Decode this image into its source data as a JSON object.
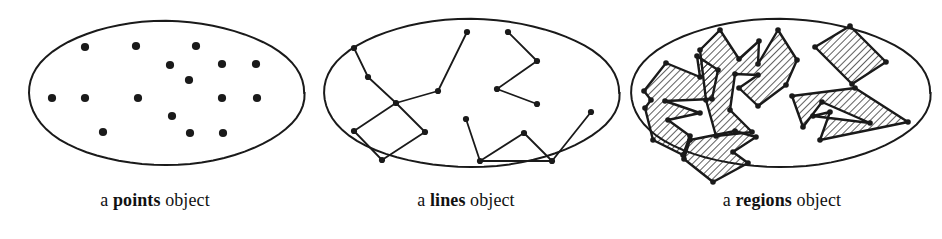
{
  "figure": {
    "width": 942,
    "height": 239,
    "background": "#ffffff",
    "ink_color": "#1a1a1a"
  },
  "panels": [
    {
      "id": "points",
      "caption_prefix": "a ",
      "caption_keyword": "points",
      "caption_suffix": " object",
      "ellipse": {
        "cx": 166,
        "cy": 93,
        "rx": 138,
        "ry": 72
      },
      "points": [
        {
          "x": 85,
          "y": 47
        },
        {
          "x": 136,
          "y": 46
        },
        {
          "x": 196,
          "y": 46
        },
        {
          "x": 170,
          "y": 65
        },
        {
          "x": 222,
          "y": 64
        },
        {
          "x": 256,
          "y": 64
        },
        {
          "x": 189,
          "y": 80
        },
        {
          "x": 52,
          "y": 98
        },
        {
          "x": 85,
          "y": 98
        },
        {
          "x": 138,
          "y": 98
        },
        {
          "x": 222,
          "y": 98
        },
        {
          "x": 257,
          "y": 98
        },
        {
          "x": 172,
          "y": 116
        },
        {
          "x": 103,
          "y": 132
        },
        {
          "x": 190,
          "y": 133
        },
        {
          "x": 223,
          "y": 133
        }
      ],
      "dot_radius": 4.1
    },
    {
      "id": "lines",
      "caption_prefix": "a ",
      "caption_keyword": "lines",
      "caption_suffix": " object",
      "ellipse": {
        "cx": 471,
        "cy": 93,
        "rx": 148,
        "ry": 74
      },
      "polylines": [
        [
          {
            "x": 354,
            "y": 48
          },
          {
            "x": 368,
            "y": 77
          },
          {
            "x": 396,
            "y": 103
          },
          {
            "x": 438,
            "y": 91
          },
          {
            "x": 467,
            "y": 32
          }
        ],
        [
          {
            "x": 354,
            "y": 131
          },
          {
            "x": 396,
            "y": 103
          },
          {
            "x": 425,
            "y": 132
          },
          {
            "x": 382,
            "y": 160
          },
          {
            "x": 354,
            "y": 131
          }
        ],
        [
          {
            "x": 508,
            "y": 32
          },
          {
            "x": 537,
            "y": 61
          },
          {
            "x": 497,
            "y": 89
          },
          {
            "x": 537,
            "y": 104
          }
        ],
        [
          {
            "x": 466,
            "y": 119
          },
          {
            "x": 480,
            "y": 161
          },
          {
            "x": 524,
            "y": 133
          },
          {
            "x": 552,
            "y": 161
          },
          {
            "x": 591,
            "y": 112
          }
        ],
        [
          {
            "x": 480,
            "y": 161
          },
          {
            "x": 552,
            "y": 161
          }
        ]
      ],
      "vertex_radius": 3.1
    },
    {
      "id": "regions",
      "caption_prefix": "a ",
      "caption_keyword": "regions",
      "caption_suffix": " object",
      "ellipse": {
        "cx": 780,
        "cy": 93,
        "rx": 150,
        "ry": 74
      },
      "hatch": {
        "angle_deg": 45,
        "spacing": 5,
        "stroke_width": 1.4
      },
      "polygons": [
        [
          {
            "x": 666,
            "y": 63
          },
          {
            "x": 700,
            "y": 77
          },
          {
            "x": 697,
            "y": 56
          },
          {
            "x": 718,
            "y": 70
          },
          {
            "x": 712,
            "y": 99
          },
          {
            "x": 665,
            "y": 101
          },
          {
            "x": 700,
            "y": 113
          },
          {
            "x": 668,
            "y": 120
          },
          {
            "x": 690,
            "y": 136
          },
          {
            "x": 683,
            "y": 155
          },
          {
            "x": 653,
            "y": 140
          },
          {
            "x": 645,
            "y": 108
          },
          {
            "x": 651,
            "y": 100
          },
          {
            "x": 644,
            "y": 91
          }
        ],
        [
          {
            "x": 700,
            "y": 50
          },
          {
            "x": 720,
            "y": 30
          },
          {
            "x": 739,
            "y": 59
          },
          {
            "x": 759,
            "y": 41
          },
          {
            "x": 758,
            "y": 64
          },
          {
            "x": 778,
            "y": 30
          },
          {
            "x": 797,
            "y": 60
          },
          {
            "x": 786,
            "y": 85
          },
          {
            "x": 758,
            "y": 106
          },
          {
            "x": 739,
            "y": 88
          },
          {
            "x": 758,
            "y": 75
          },
          {
            "x": 735,
            "y": 74
          },
          {
            "x": 730,
            "y": 110
          },
          {
            "x": 752,
            "y": 132
          },
          {
            "x": 716,
            "y": 136
          },
          {
            "x": 706,
            "y": 100
          }
        ],
        [
          {
            "x": 690,
            "y": 140
          },
          {
            "x": 735,
            "y": 131
          },
          {
            "x": 756,
            "y": 137
          },
          {
            "x": 733,
            "y": 152
          },
          {
            "x": 748,
            "y": 163
          },
          {
            "x": 713,
            "y": 182
          },
          {
            "x": 684,
            "y": 159
          }
        ],
        [
          {
            "x": 815,
            "y": 47
          },
          {
            "x": 850,
            "y": 26
          },
          {
            "x": 886,
            "y": 62
          },
          {
            "x": 852,
            "y": 84
          }
        ],
        [
          {
            "x": 792,
            "y": 96
          },
          {
            "x": 855,
            "y": 88
          },
          {
            "x": 908,
            "y": 122
          },
          {
            "x": 820,
            "y": 140
          },
          {
            "x": 830,
            "y": 112
          },
          {
            "x": 813,
            "y": 116
          },
          {
            "x": 870,
            "y": 123
          },
          {
            "x": 822,
            "y": 102
          },
          {
            "x": 803,
            "y": 127
          }
        ]
      ],
      "vertex_radius": 2.8
    }
  ]
}
